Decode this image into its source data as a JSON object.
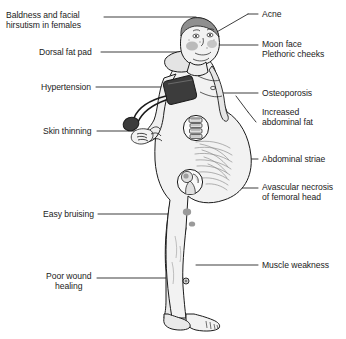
{
  "diagram": {
    "background_color": "#ffffff",
    "text_color": "#1b1b1b",
    "line_color": "#1b1b1b",
    "skin_fill": "#f2f2f2",
    "shade_fill": "#d8d8d8",
    "cuff_fill": "#3c3c3c",
    "cheek_fill": "#a8a8a8",
    "bruise_fill": "#9a9a9a"
  },
  "labels": {
    "left": [
      {
        "id": "baldness",
        "text": "Baldness and facial\nhirsutism in females",
        "x": 6,
        "y": 11,
        "align": "left"
      },
      {
        "id": "dorsal_fat",
        "text": "Dorsal fat pad",
        "x": 39,
        "y": 48,
        "align": "left"
      },
      {
        "id": "hypertension",
        "text": "Hypertension",
        "x": 41,
        "y": 83,
        "align": "left"
      },
      {
        "id": "skin_thinning",
        "text": "Skin thinning",
        "x": 43,
        "y": 127,
        "align": "left"
      },
      {
        "id": "easy_bruising",
        "text": "Easy bruising",
        "x": 43,
        "y": 210,
        "align": "left"
      },
      {
        "id": "poor_wound",
        "text": "Poor wound\nhealing",
        "x": 46,
        "y": 272,
        "align": "center"
      }
    ],
    "right": [
      {
        "id": "acne",
        "text": "Acne",
        "x": 262,
        "y": 10
      },
      {
        "id": "moon_face",
        "text": "Moon face\nPlethoric cheeks",
        "x": 262,
        "y": 40
      },
      {
        "id": "osteoporosis",
        "text": "Osteoporosis",
        "x": 262,
        "y": 89
      },
      {
        "id": "abdominal_fat",
        "text": "Increased\nabdominal fat",
        "x": 262,
        "y": 108
      },
      {
        "id": "abdominal_striae",
        "text": "Abdominal striae",
        "x": 262,
        "y": 155
      },
      {
        "id": "avascular",
        "text": "Avascular necrosis\nof femoral head",
        "x": 262,
        "y": 183
      },
      {
        "id": "muscle_weakness",
        "text": "Muscle weakness",
        "x": 262,
        "y": 261
      }
    ]
  },
  "insets": [
    {
      "id": "vertebra-inset",
      "label": "osteoporosis vertebrae",
      "cx": 196,
      "cy": 128,
      "r": 13
    },
    {
      "id": "femoral-head-inset",
      "label": "femoral head",
      "cx": 190,
      "cy": 182,
      "r": 13
    }
  ],
  "markers": {
    "bruises": [
      {
        "cx": 187,
        "cy": 212,
        "rx": 4.2,
        "ry": 3.4
      },
      {
        "cx": 192,
        "cy": 224,
        "rx": 3.2,
        "ry": 2.6
      }
    ],
    "ulcer": {
      "cx": 186,
      "cy": 281,
      "r": 3.0
    }
  }
}
